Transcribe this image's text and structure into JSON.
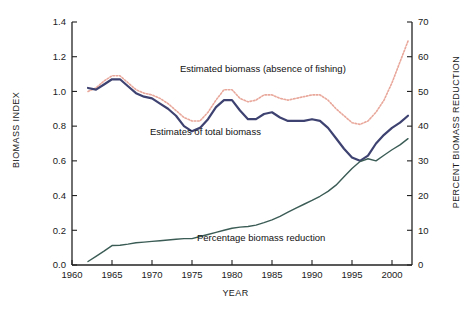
{
  "figure": {
    "background": "#ffffff",
    "frame_color": "#222222"
  },
  "chart_data": {
    "type": "line",
    "title": "",
    "subtitle": "",
    "xlabel": "YEAR",
    "ylabel": "BIOMASS INDEX",
    "ylabel_right": "PERCENT BIOMASS REDUCTION",
    "xlim": [
      1960,
      2002.5
    ],
    "ylim": [
      0.0,
      1.4
    ],
    "ylim_right": [
      0,
      70
    ],
    "grid": false,
    "legend": "inline-annotations",
    "xticks": [
      1960,
      1965,
      1970,
      1975,
      1980,
      1985,
      1990,
      1995,
      2000
    ],
    "xticklabels": [
      "1960",
      "1965",
      "1970",
      "1975",
      "1980",
      "1985",
      "1990",
      "1995",
      "2000"
    ],
    "yticks": [
      0.0,
      0.2,
      0.4,
      0.6,
      0.8,
      1.0,
      1.2,
      1.4
    ],
    "yticklabels": [
      "0.0",
      "0.2",
      "0.4",
      "0.6",
      "0.8",
      "1.0",
      "1.2",
      "1.4"
    ],
    "yticks_right": [
      0,
      10,
      20,
      30,
      40,
      50,
      60,
      70
    ],
    "yticklabels_right": [
      "0",
      "10",
      "20",
      "30",
      "40",
      "50",
      "60",
      "70"
    ],
    "series": [
      {
        "name": "Estimated biomass (absence of fishing)",
        "axis": "left",
        "color": "#e8a79a",
        "style": "dotted",
        "width": 1.6,
        "x": [
          1962,
          1963,
          1964,
          1965,
          1966,
          1967,
          1968,
          1969,
          1970,
          1971,
          1972,
          1973,
          1974,
          1975,
          1976,
          1977,
          1978,
          1979,
          1980,
          1981,
          1982,
          1983,
          1984,
          1985,
          1986,
          1987,
          1988,
          1989,
          1990,
          1991,
          1992,
          1993,
          1994,
          1995,
          1996,
          1997,
          1998,
          1999,
          2000,
          2001,
          2002
        ],
        "y": [
          1.0,
          1.02,
          1.06,
          1.09,
          1.09,
          1.05,
          1.01,
          0.99,
          0.98,
          0.96,
          0.93,
          0.89,
          0.85,
          0.83,
          0.83,
          0.88,
          0.95,
          1.01,
          1.01,
          0.96,
          0.94,
          0.95,
          0.98,
          0.98,
          0.96,
          0.95,
          0.96,
          0.97,
          0.98,
          0.98,
          0.95,
          0.9,
          0.86,
          0.82,
          0.81,
          0.83,
          0.88,
          0.95,
          1.05,
          1.17,
          1.29
        ]
      },
      {
        "name": "Estimates of total biomass",
        "axis": "left",
        "color": "#3d4270",
        "style": "solid",
        "width": 2.2,
        "x": [
          1962,
          1963,
          1964,
          1965,
          1966,
          1967,
          1968,
          1969,
          1970,
          1971,
          1972,
          1973,
          1974,
          1975,
          1976,
          1977,
          1978,
          1979,
          1980,
          1981,
          1982,
          1983,
          1984,
          1985,
          1986,
          1987,
          1988,
          1989,
          1990,
          1991,
          1992,
          1993,
          1994,
          1995,
          1996,
          1997,
          1998,
          1999,
          2000,
          2001,
          2002
        ],
        "y": [
          1.02,
          1.01,
          1.04,
          1.07,
          1.07,
          1.03,
          0.99,
          0.97,
          0.96,
          0.93,
          0.9,
          0.86,
          0.8,
          0.77,
          0.79,
          0.84,
          0.91,
          0.95,
          0.95,
          0.89,
          0.84,
          0.84,
          0.87,
          0.88,
          0.85,
          0.83,
          0.83,
          0.83,
          0.84,
          0.83,
          0.79,
          0.73,
          0.67,
          0.62,
          0.6,
          0.63,
          0.7,
          0.75,
          0.79,
          0.82,
          0.86
        ]
      },
      {
        "name": "Percentage biomass reduction",
        "axis": "right",
        "color": "#3b5c55",
        "style": "solid",
        "width": 1.4,
        "x": [
          1962,
          1963,
          1964,
          1965,
          1966,
          1967,
          1968,
          1969,
          1970,
          1971,
          1972,
          1973,
          1974,
          1975,
          1976,
          1977,
          1978,
          1979,
          1980,
          1981,
          1982,
          1983,
          1984,
          1985,
          1986,
          1987,
          1988,
          1989,
          1990,
          1991,
          1992,
          1993,
          1994,
          1995,
          1996,
          1997,
          1998,
          1999,
          2000,
          2001,
          2002
        ],
        "y": [
          1.0,
          2.5,
          4.0,
          5.6,
          5.7,
          6.0,
          6.4,
          6.6,
          6.8,
          7.0,
          7.2,
          7.4,
          7.6,
          7.6,
          8.2,
          8.8,
          9.4,
          10.0,
          10.6,
          10.9,
          11.1,
          11.5,
          12.2,
          13.0,
          14.0,
          15.2,
          16.4,
          17.5,
          18.6,
          19.8,
          21.2,
          23.0,
          25.4,
          27.8,
          29.8,
          30.6,
          30.0,
          31.6,
          33.2,
          34.6,
          36.4
        ]
      }
    ],
    "annotations": [
      {
        "text": "Estimated biomass (absence of fishing)",
        "x": 1978.5,
        "y": 1.12
      },
      {
        "text": "Estimates of total biomass",
        "x": 1975.0,
        "y": 0.77
      },
      {
        "text": "Percentage biomass reduction",
        "x": 1980.0,
        "y": 0.16
      }
    ]
  },
  "axes": {
    "left_title": "BIOMASS INDEX",
    "right_title": "PERCENT BIOMASS REDUCTION",
    "x_title": "YEAR"
  }
}
